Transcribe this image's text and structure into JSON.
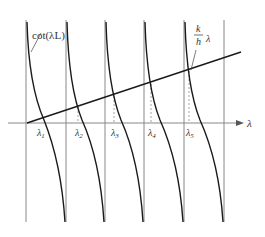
{
  "figure": {
    "type": "graphical solution of transcendental equation",
    "curve_label": "cot(λL)",
    "line_label_num": "k",
    "line_label_den": "h",
    "line_label_var": "λ",
    "axis_label": "λ",
    "root_labels": [
      "λ1",
      "λ2",
      "λ3",
      "λ4",
      "λ5"
    ],
    "root_label_parts": [
      {
        "base": "λ",
        "sub": "1"
      },
      {
        "base": "λ",
        "sub": "2"
      },
      {
        "base": "λ",
        "sub": "3"
      },
      {
        "base": "λ",
        "sub": "4"
      },
      {
        "base": "λ",
        "sub": "5"
      }
    ],
    "colors": {
      "curve": "#1a1a1a",
      "asymptote": "#7a7a7a",
      "axis": "#888888",
      "dashed": "#8a8a8a",
      "text": "#333333"
    }
  }
}
